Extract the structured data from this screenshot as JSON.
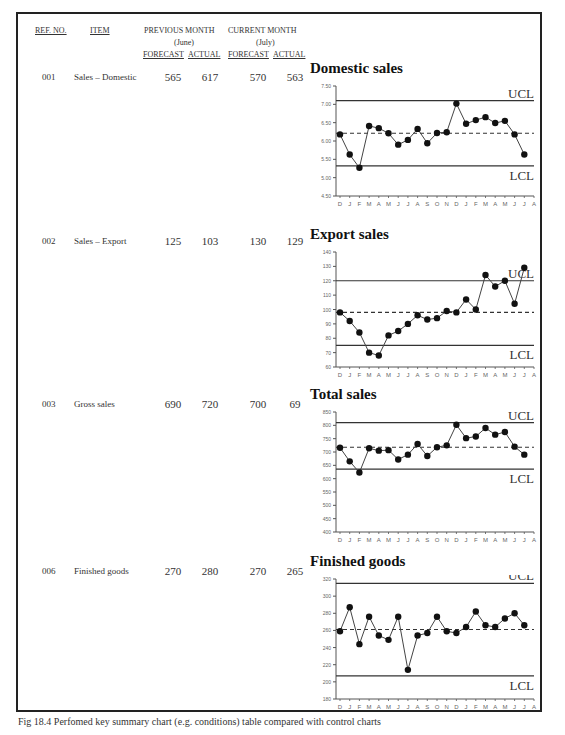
{
  "table": {
    "headers": {
      "ref_no": "REF. NO.",
      "item": "ITEM",
      "previous_month": "PREVIOUS MONTH",
      "previous_month_sub": "(June)",
      "current_month": "CURRENT MONTH",
      "current_month_sub": "(July)",
      "forecast": "FORECAST",
      "actual": "ACTUAL"
    },
    "rows": [
      {
        "ref": "001",
        "item": "Sales – Domestic",
        "prev_forecast": "565",
        "prev_actual": "617",
        "cur_forecast": "570",
        "cur_actual": "563"
      },
      {
        "ref": "002",
        "item": "Sales – Export",
        "prev_forecast": "125",
        "prev_actual": "103",
        "cur_forecast": "130",
        "cur_actual": "129"
      },
      {
        "ref": "003",
        "item": "Gross sales",
        "prev_forecast": "690",
        "prev_actual": "720",
        "cur_forecast": "700",
        "cur_actual": "69"
      },
      {
        "ref": "006",
        "item": "Finished goods",
        "prev_forecast": "270",
        "prev_actual": "280",
        "cur_forecast": "270",
        "cur_actual": "265"
      }
    ]
  },
  "chart_data": [
    {
      "type": "line",
      "title": "Domestic sales",
      "x": [
        "D",
        "J",
        "F",
        "M",
        "A",
        "M",
        "J",
        "J",
        "A",
        "S",
        "O",
        "N",
        "D",
        "J",
        "F",
        "M",
        "A",
        "M",
        "J",
        "J",
        "A"
      ],
      "series": [
        {
          "name": "Domestic sales",
          "values": [
            618,
            563,
            527,
            641,
            635,
            621,
            590,
            603,
            633,
            594,
            622,
            624,
            702,
            647,
            657,
            665,
            649,
            655,
            618,
            563
          ]
        }
      ],
      "ytick_labels": [
        "7.50",
        "7.00",
        "6.50",
        "6.00",
        "5.50",
        "5.00",
        "4.50"
      ],
      "ylim": [
        450,
        750
      ],
      "ucl": 710,
      "lcl": 532,
      "mean": 621,
      "ucl_label": "UCL",
      "lcl_label": "LCL",
      "xlabel": "",
      "ylabel": ""
    },
    {
      "type": "line",
      "title": "Export sales",
      "x": [
        "D",
        "J",
        "F",
        "M",
        "A",
        "M",
        "J",
        "J",
        "A",
        "S",
        "O",
        "N",
        "D",
        "J",
        "F",
        "M",
        "A",
        "M",
        "J",
        "J",
        "A"
      ],
      "series": [
        {
          "name": "Export sales",
          "values": [
            98,
            92,
            84,
            70,
            68,
            82,
            85,
            90,
            96,
            93,
            94,
            99,
            98,
            107,
            100,
            124,
            116,
            120,
            104,
            129
          ]
        }
      ],
      "ytick_labels": [
        "140",
        "130",
        "120",
        "110",
        "100",
        "90",
        "80",
        "70",
        "60"
      ],
      "ylim": [
        60,
        140
      ],
      "ucl": 120,
      "lcl": 75,
      "mean": 98,
      "ucl_label": "UCL",
      "lcl_label": "LCL",
      "xlabel": "",
      "ylabel": ""
    },
    {
      "type": "line",
      "title": "Total sales",
      "x": [
        "D",
        "J",
        "F",
        "M",
        "A",
        "M",
        "J",
        "J",
        "A",
        "S",
        "O",
        "N",
        "D",
        "J",
        "F",
        "M",
        "A",
        "M",
        "J",
        "J",
        "A"
      ],
      "series": [
        {
          "name": "Total sales",
          "values": [
            716,
            665,
            623,
            714,
            705,
            707,
            672,
            690,
            730,
            685,
            718,
            725,
            802,
            752,
            758,
            790,
            765,
            775,
            720,
            690
          ]
        }
      ],
      "ytick_labels": [
        "850",
        "800",
        "750",
        "700",
        "650",
        "600",
        "550",
        "500",
        "450",
        "400"
      ],
      "ylim": [
        400,
        850
      ],
      "ucl": 810,
      "lcl": 636,
      "mean": 718,
      "ucl_label": "UCL",
      "lcl_label": "LCL",
      "xlabel": "",
      "ylabel": ""
    },
    {
      "type": "line",
      "title": "Finished goods",
      "x": [
        "D",
        "J",
        "F",
        "M",
        "A",
        "M",
        "J",
        "J",
        "A",
        "S",
        "O",
        "N",
        "D",
        "J",
        "F",
        "M",
        "A",
        "M",
        "J",
        "J",
        "A"
      ],
      "series": [
        {
          "name": "Finished goods",
          "values": [
            259,
            287,
            244,
            276,
            254,
            249,
            276,
            214,
            254,
            257,
            276,
            259,
            257,
            264,
            282,
            266,
            264,
            274,
            280,
            266
          ]
        }
      ],
      "ytick_labels": [
        "320",
        "300",
        "280",
        "260",
        "240",
        "220",
        "200",
        "180"
      ],
      "ylim": [
        180,
        320
      ],
      "ucl": 315,
      "lcl": 207,
      "mean": 261,
      "ucl_label": "UCL",
      "lcl_label": "LCL",
      "xlabel": "",
      "ylabel": ""
    }
  ],
  "caption": "Fig 18.4 Perfomed key summary chart (e.g. conditions) table compared with control charts"
}
